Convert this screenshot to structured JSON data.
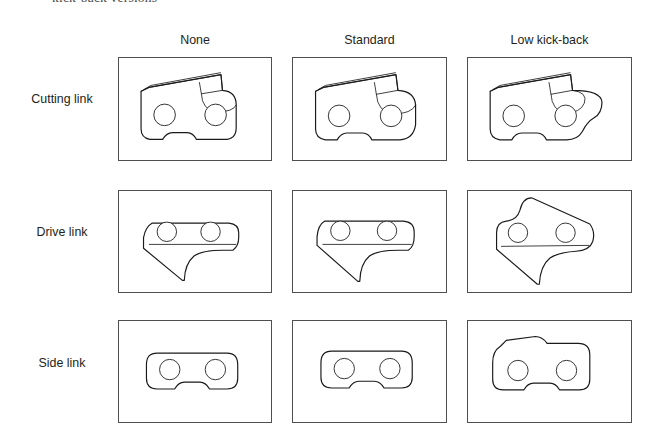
{
  "figure": {
    "top_caption": "kick-back versions",
    "column_headers": [
      {
        "label": "None"
      },
      {
        "label": "Standard"
      },
      {
        "label": "Low kick-back"
      }
    ],
    "row_labels": [
      {
        "label": "Cutting link"
      },
      {
        "label": "Drive link"
      },
      {
        "label": "Side link"
      }
    ],
    "cells": [
      {
        "row": "Cutting link",
        "column": "None",
        "drawing": "cutting-link-none"
      },
      {
        "row": "Cutting link",
        "column": "Standard",
        "drawing": "cutting-link-standard"
      },
      {
        "row": "Cutting link",
        "column": "Low kick-back",
        "drawing": "cutting-link-low-kick-back"
      },
      {
        "row": "Drive link",
        "column": "None",
        "drawing": "drive-link-none"
      },
      {
        "row": "Drive link",
        "column": "Standard",
        "drawing": "drive-link-standard"
      },
      {
        "row": "Drive link",
        "column": "Low kick-back",
        "drawing": "drive-link-low-kick-back"
      },
      {
        "row": "Side link",
        "column": "None",
        "drawing": "side-link-none"
      },
      {
        "row": "Side link",
        "column": "Standard",
        "drawing": "side-link-standard"
      },
      {
        "row": "Side link",
        "column": "Low kick-back",
        "drawing": "side-link-low-kick-back"
      }
    ],
    "colors": {
      "background": "#ffffff",
      "box_border": "#4f4f4f",
      "line_art": "#1a1a1a",
      "text": "#231f20",
      "caption_text": "#4a4a4a"
    }
  }
}
